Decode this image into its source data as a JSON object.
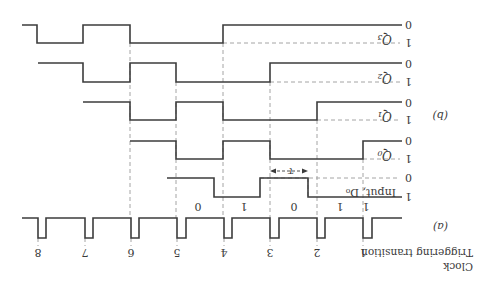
{
  "figure": {
    "orientation": "rotated 180 degrees",
    "part_a_label": "(a)",
    "part_b_label": "(b)",
    "clock_label_line1": "Clock",
    "clock_label_line2": "Triggering transition",
    "tau_label": "τ",
    "clock_transitions": [
      "1",
      "2",
      "3",
      "4",
      "5",
      "6",
      "7",
      "8"
    ],
    "input_bits": [
      "1",
      "1",
      "0",
      "1",
      "0"
    ],
    "signals": [
      {
        "id": "Q3",
        "label": "Q₃",
        "level_top": "0",
        "level_bottom": "1"
      },
      {
        "id": "Q2",
        "label": "Q₂",
        "level_top": "0",
        "level_bottom": "1"
      },
      {
        "id": "Q1",
        "label": "Q₁",
        "level_top": "0",
        "level_bottom": "1"
      },
      {
        "id": "Q0",
        "label": "Q₀",
        "level_top": "0",
        "level_bottom": "1"
      },
      {
        "id": "D0",
        "label": "Input, D₀",
        "level_top": "0",
        "level_bottom": "1"
      }
    ],
    "colors": {
      "wave": "#3c3c3c",
      "dashed": "#9a9a9a",
      "text": "#3a3a3a",
      "background": "#ffffff"
    }
  }
}
